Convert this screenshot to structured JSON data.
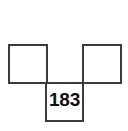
{
  "figure": {
    "type": "square-grid-diagram",
    "background_color": "#ffffff",
    "stroke_color": "#3b3b3b",
    "stroke_width": 2,
    "text_color": "#111111",
    "canvas": {
      "width": 128,
      "height": 131
    },
    "cells": [
      {
        "id": "top-left",
        "label": "",
        "x": 9,
        "y": 45,
        "width": 38,
        "height": 38,
        "filled": false
      },
      {
        "id": "top-right",
        "label": "",
        "x": 83,
        "y": 45,
        "width": 38,
        "height": 38,
        "filled": false
      },
      {
        "id": "bottom-center",
        "label": "183",
        "x": 46,
        "y": 83,
        "width": 37,
        "height": 38,
        "filled": false
      }
    ],
    "connectors": [
      {
        "id": "top-row-baseline",
        "x1": 9,
        "y1": 83,
        "x2": 121,
        "y2": 83
      }
    ]
  }
}
